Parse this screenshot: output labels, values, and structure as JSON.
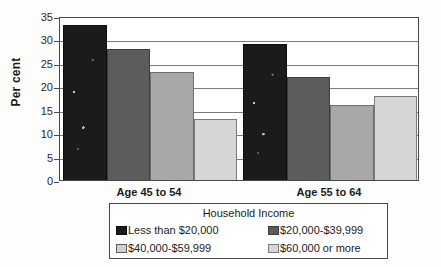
{
  "chart_data": {
    "type": "bar",
    "title": "",
    "xlabel": "",
    "ylabel": "Per cent",
    "ylim": [
      0,
      35
    ],
    "yticks": [
      0,
      5,
      10,
      15,
      20,
      25,
      30,
      35
    ],
    "ytick_labels": [
      "0",
      "5",
      "10",
      "15",
      "20",
      "25",
      "30",
      "35"
    ],
    "grid": true,
    "legend_position": "bottom",
    "legend_title": "Household Income",
    "categories": [
      "Age 45 to 54",
      "Age 55 to 64"
    ],
    "series": [
      {
        "name": "Less than $20,000",
        "color": "#1c1a1b",
        "values": [
          33,
          29
        ]
      },
      {
        "name": "$20,000-$39,999",
        "color": "#5c5c5c",
        "values": [
          28,
          22
        ]
      },
      {
        "name": "$40,000-$59,999",
        "color": "#a8a8a8",
        "values": [
          23,
          16
        ]
      },
      {
        "name": "$60,000 or more",
        "color": "#d6d6d6",
        "values": [
          13,
          18
        ]
      }
    ]
  },
  "legend": {
    "title": "Household Income",
    "entries": [
      {
        "label": "Less than $20,000"
      },
      {
        "label": "$20,000-$39,999"
      },
      {
        "label": "$40,000-$59,999"
      },
      {
        "label": "$60,000 or more"
      }
    ]
  },
  "axis": {
    "y_title": "Per cent",
    "y_tick_labels": [
      "35",
      "30",
      "25",
      "20",
      "15",
      "10",
      "5",
      "0"
    ]
  },
  "groups": [
    {
      "label": "Age 45 to 54"
    },
    {
      "label": "Age 55 to 64"
    }
  ]
}
